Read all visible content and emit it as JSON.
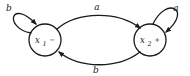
{
  "diagram": {
    "type": "state-machine",
    "background_color": "#ffffff",
    "stroke_color": "#1a1a1a",
    "states": [
      {
        "id": "state-x1",
        "base": "x",
        "sub": "1",
        "sign": "−"
      },
      {
        "id": "state-x2",
        "base": "x",
        "sub": "2",
        "sign": "+"
      }
    ],
    "transitions": {
      "self_loop_left_label": "b",
      "self_loop_right_label": "a",
      "top_arc_label": "a",
      "bottom_arc_label": "b"
    }
  }
}
